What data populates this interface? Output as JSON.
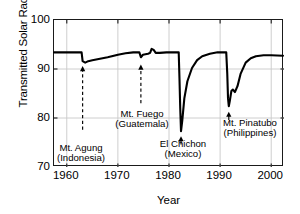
{
  "chart_data": {
    "type": "line",
    "title": "",
    "xlabel": "Year",
    "ylabel": "Transmitted Solar Radiation (%)",
    "xlim": [
      1957.5,
      2002.5
    ],
    "ylim": [
      70,
      100
    ],
    "xticks": [
      1960,
      1970,
      1980,
      1990,
      2000
    ],
    "yticks": [
      70,
      80,
      90,
      100
    ],
    "grid": true,
    "legend_position": "none",
    "series": [
      {
        "name": "Transmitted Solar Radiation",
        "points": [
          [
            1957.5,
            93.4
          ],
          [
            1960.0,
            93.4
          ],
          [
            1962.0,
            93.4
          ],
          [
            1962.9,
            93.4
          ],
          [
            1963.1,
            91.6
          ],
          [
            1963.6,
            91.3
          ],
          [
            1964.2,
            91.6
          ],
          [
            1965.0,
            91.8
          ],
          [
            1966.5,
            92.1
          ],
          [
            1968.0,
            92.4
          ],
          [
            1970.0,
            92.9
          ],
          [
            1971.5,
            93.2
          ],
          [
            1973.0,
            93.4
          ],
          [
            1974.2,
            93.4
          ],
          [
            1974.5,
            92.4
          ],
          [
            1974.9,
            92.9
          ],
          [
            1975.4,
            93.0
          ],
          [
            1975.9,
            93.1
          ],
          [
            1976.3,
            93.3
          ],
          [
            1976.6,
            94.1
          ],
          [
            1977.0,
            93.9
          ],
          [
            1977.4,
            93.3
          ],
          [
            1978.2,
            93.3
          ],
          [
            1979.5,
            93.4
          ],
          [
            1981.0,
            93.4
          ],
          [
            1981.9,
            93.4
          ],
          [
            1982.05,
            88.0
          ],
          [
            1982.2,
            82.0
          ],
          [
            1982.35,
            77.3
          ],
          [
            1982.6,
            79.5
          ],
          [
            1983.0,
            84.0
          ],
          [
            1983.6,
            87.5
          ],
          [
            1984.5,
            90.2
          ],
          [
            1985.5,
            91.8
          ],
          [
            1986.5,
            92.6
          ],
          [
            1988.0,
            93.1
          ],
          [
            1989.5,
            93.4
          ],
          [
            1990.8,
            93.4
          ],
          [
            1991.2,
            93.4
          ],
          [
            1991.4,
            89.0
          ],
          [
            1991.55,
            84.0
          ],
          [
            1991.7,
            82.4
          ],
          [
            1991.9,
            83.5
          ],
          [
            1992.2,
            85.5
          ],
          [
            1992.5,
            85.8
          ],
          [
            1992.9,
            85.3
          ],
          [
            1993.4,
            86.5
          ],
          [
            1994.0,
            89.0
          ],
          [
            1995.0,
            91.3
          ],
          [
            1996.0,
            92.2
          ],
          [
            1997.0,
            92.6
          ],
          [
            1998.5,
            92.8
          ],
          [
            2000.0,
            92.8
          ],
          [
            2002.3,
            92.7
          ]
        ]
      }
    ],
    "annotations": [
      {
        "id": "agung",
        "name_line1": "Mt. Agung",
        "name_line2": "(Indonesia)",
        "event_year": 1963.1,
        "arrow_tip_y": 90.6,
        "arrow_tail_y": 77.6,
        "connector": "dashed"
      },
      {
        "id": "fuego",
        "name_line1": "Mt. Fuego",
        "name_line2": "(Guatemala)",
        "event_year": 1974.5,
        "arrow_tip_y": 90.9,
        "arrow_tail_y": 83.0,
        "connector": "dashed"
      },
      {
        "id": "elchichon",
        "name_line1": "El Chichon",
        "name_line2": "(Mexico)",
        "event_year": 1982.35,
        "arrow_tip_y": 76.3,
        "arrow_tail_y": 74.6,
        "connector": "solid"
      },
      {
        "id": "pinatubo",
        "name_line1": "Mt. Pinatubo",
        "name_line2": "(Philippines)",
        "event_year": 1991.7,
        "arrow_tip_y": 81.3,
        "arrow_tail_y": 79.6,
        "connector": "solid"
      }
    ],
    "colors": {
      "line": "#000000",
      "frame": "#1a1a1a",
      "grid": "#c8c8c8",
      "background": "#ffffff"
    }
  },
  "axes": {
    "y_title": "Transmitted Solar Radiation (%)",
    "x_title": "Year",
    "y_tick_labels": [
      "100",
      "90",
      "80",
      "70"
    ],
    "x_tick_labels": [
      "1960",
      "1970",
      "1980",
      "1990",
      "2000"
    ]
  },
  "annotation_labels": {
    "agung": "Mt. Agung\n(Indonesia)",
    "fuego": "Mt. Fuego\n(Guatemala)",
    "elchichon": "El Chichon\n(Mexico)",
    "pinatubo": "Mt. Pinatubo\n(Philippines)"
  }
}
